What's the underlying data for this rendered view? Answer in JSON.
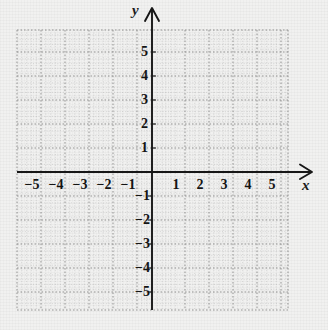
{
  "figure": {
    "kind": "cartesian-coordinate-grid",
    "background_color": "#f1f1f0",
    "axis_color": "#161616",
    "gridline_color": "#9a9a9a",
    "label_color": "#141414"
  },
  "axes": {
    "x_axis_label": "x",
    "y_axis_label": "y",
    "x_arrow": "arrow-right",
    "y_arrow": "arrow-up"
  },
  "chart_data": {
    "type": "scatter",
    "title": "",
    "xlabel": "x",
    "ylabel": "y",
    "xlim": [
      -5.7,
      5.7
    ],
    "ylim": [
      -5.9,
      5.8
    ],
    "grid": true,
    "legend": "none",
    "x_ticks": [
      -5,
      -4,
      -3,
      -2,
      -1,
      1,
      2,
      3,
      4,
      5
    ],
    "y_ticks": [
      5,
      4,
      3,
      2,
      1,
      -1,
      -2,
      -3,
      -4,
      -5
    ],
    "x_tick_labels": [
      "−5",
      "−4",
      "−3",
      "−2",
      "−1",
      "1",
      "2",
      "3",
      "4",
      "5"
    ],
    "y_tick_labels": [
      "5",
      "4",
      "3",
      "2",
      "1",
      "−1",
      "−2",
      "−3",
      "−4",
      "−5"
    ],
    "minor_subdivisions": 4,
    "series": [
      {
        "name": "plotted-points",
        "x": [],
        "y": []
      }
    ]
  },
  "x_labels": [
    {
      "text": "−5",
      "cx": 32,
      "top": 178
    },
    {
      "text": "−4",
      "cx": 56,
      "top": 178
    },
    {
      "text": "−3",
      "cx": 80,
      "top": 178
    },
    {
      "text": "−2",
      "cx": 104,
      "top": 178
    },
    {
      "text": "−1",
      "cx": 128,
      "top": 178
    },
    {
      "text": "1",
      "cx": 176,
      "top": 178
    },
    {
      "text": "2",
      "cx": 200,
      "top": 178
    },
    {
      "text": "3",
      "cx": 224,
      "top": 178
    },
    {
      "text": "4",
      "cx": 248,
      "top": 178
    },
    {
      "text": "5",
      "cx": 272,
      "top": 178
    }
  ],
  "y_labels": [
    {
      "text": "5",
      "cy": 52,
      "right": 148
    },
    {
      "text": "4",
      "cy": 76,
      "right": 148
    },
    {
      "text": "3",
      "cy": 100,
      "right": 148
    },
    {
      "text": "2",
      "cy": 124,
      "right": 148
    },
    {
      "text": "1",
      "cy": 148,
      "right": 148
    },
    {
      "text": "−1",
      "cy": 196,
      "right": 150
    },
    {
      "text": "−2",
      "cy": 220,
      "right": 150
    },
    {
      "text": "−3",
      "cy": 244,
      "right": 150
    },
    {
      "text": "−4",
      "cy": 268,
      "right": 150
    },
    {
      "text": "−5",
      "cy": 292,
      "right": 150
    }
  ]
}
